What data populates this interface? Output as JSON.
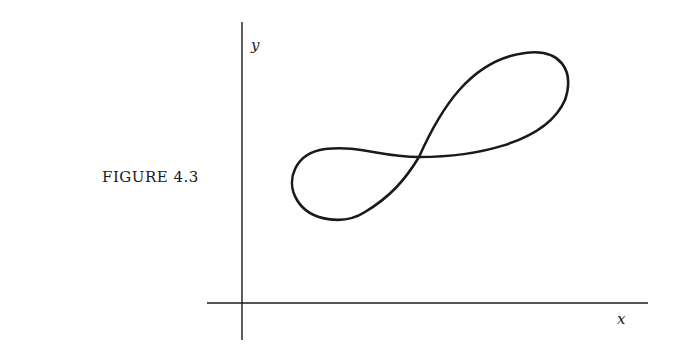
{
  "figure": {
    "caption": "FIGURE 4.3",
    "y_label": "y",
    "x_label": "x",
    "curve_description": "figure-eight (lemniscate-like) closed curve, tilted upward to the right, self-intersecting at center",
    "colors": {
      "ink": "#1a1a1a",
      "background": "#ffffff"
    }
  }
}
